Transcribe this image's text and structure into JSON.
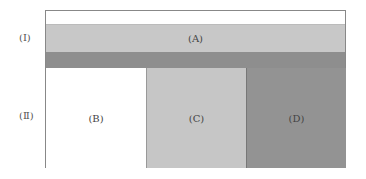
{
  "diagram": {
    "row_labels": [
      "(Ⅰ)",
      "(Ⅱ)"
    ],
    "regions": {
      "A": {
        "label": "(A)",
        "color": "#c8c8c8"
      },
      "B": {
        "label": "(B)",
        "color": "#ffffff"
      },
      "C": {
        "label": "(C)",
        "color": "#c6c6c6"
      },
      "D": {
        "label": "(D)",
        "color": "#939393"
      }
    },
    "bands": {
      "top": {
        "color": "#ffffff"
      },
      "dark": {
        "color": "#8e8e8e"
      }
    }
  }
}
